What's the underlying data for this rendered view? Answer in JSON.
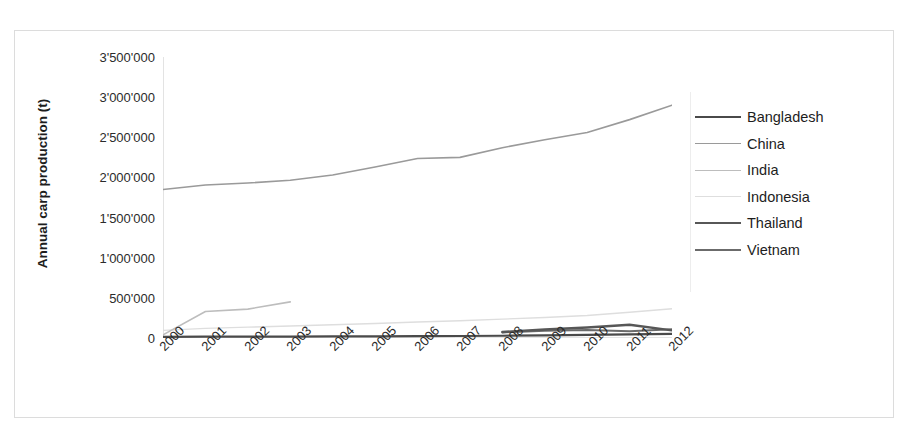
{
  "chart_data": {
    "type": "line",
    "title": "",
    "xlabel": "",
    "ylabel": "Annual carp production (t)",
    "x": [
      2000,
      2001,
      2002,
      2003,
      2004,
      2005,
      2006,
      2007,
      2008,
      2009,
      2010,
      2011,
      2012
    ],
    "categories": [
      "2000",
      "2001",
      "2002",
      "2003",
      "2004",
      "2005",
      "2006",
      "2007",
      "2008",
      "2009",
      "2010",
      "2011",
      "2012"
    ],
    "ylim": [
      0,
      3500000
    ],
    "yticks": [
      0,
      500000,
      1000000,
      1500000,
      2000000,
      2500000,
      3000000,
      3500000
    ],
    "ytick_labels": [
      "0",
      "500'000",
      "1'000'000",
      "1'500'000",
      "2'000'000",
      "2'500'000",
      "3'000'000",
      "3'500'000"
    ],
    "grid": false,
    "legend_position": "right",
    "series": [
      {
        "name": "Bangladesh",
        "color": "#4a4a4a",
        "width": 2.2,
        "values": [
          15000,
          16000,
          17000,
          18000,
          19000,
          21000,
          23000,
          25000,
          28000,
          32000,
          38000,
          45000,
          52000
        ]
      },
      {
        "name": "China",
        "color": "#9a9a9a",
        "width": 1.6,
        "values": [
          1850000,
          1905000,
          1930000,
          1965000,
          2030000,
          2130000,
          2235000,
          2250000,
          2370000,
          2470000,
          2560000,
          2720000,
          2900000
        ]
      },
      {
        "name": "India",
        "color": "#bdbdbd",
        "width": 1.6,
        "values": [
          40000,
          330000,
          360000,
          450000,
          null,
          null,
          null,
          null,
          null,
          null,
          null,
          null,
          null
        ]
      },
      {
        "name": "Indonesia",
        "color": "#dedede",
        "width": 1.4,
        "values": [
          95000,
          120000,
          135000,
          150000,
          165000,
          180000,
          200000,
          215000,
          235000,
          255000,
          280000,
          320000,
          365000
        ]
      },
      {
        "name": "Thailand",
        "color": "#575757",
        "width": 2.4,
        "values": [
          null,
          null,
          null,
          null,
          null,
          null,
          null,
          null,
          75000,
          105000,
          130000,
          165000,
          95000
        ]
      },
      {
        "name": "Vietnam",
        "color": "#6b6b6b",
        "width": 2.0,
        "values": [
          null,
          null,
          null,
          null,
          null,
          null,
          null,
          null,
          70000,
          90000,
          100000,
          85000,
          110000
        ]
      }
    ]
  },
  "legend": {
    "items": [
      {
        "label": "Bangladesh"
      },
      {
        "label": "China"
      },
      {
        "label": "India"
      },
      {
        "label": "Indonesia"
      },
      {
        "label": "Thailand"
      },
      {
        "label": "Vietnam"
      }
    ]
  }
}
